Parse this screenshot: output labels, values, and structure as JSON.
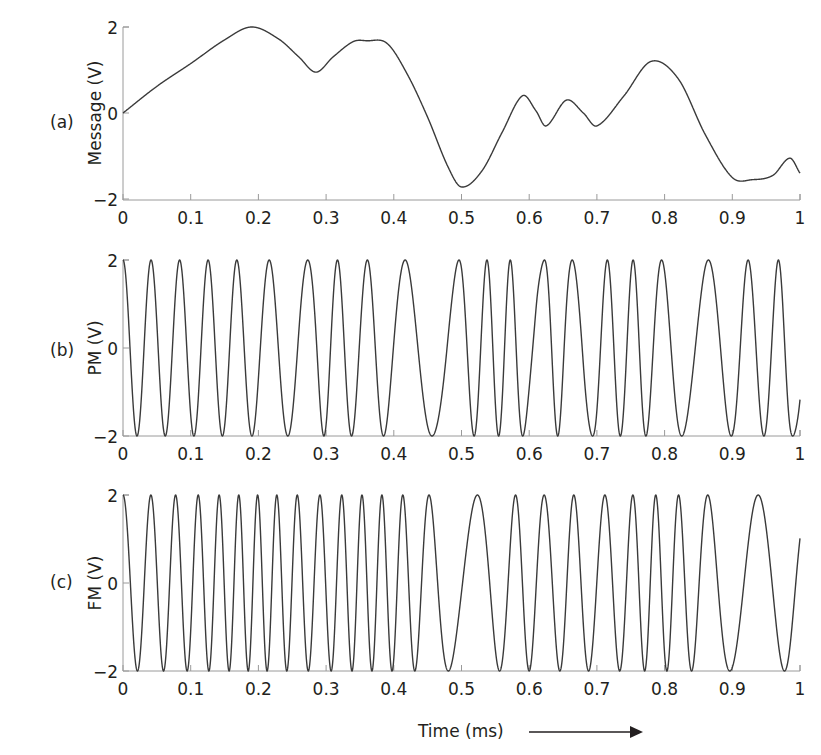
{
  "figure": {
    "xlabel": "Time (ms)",
    "arrow": "right-arrow"
  },
  "panels": [
    {
      "tag": "(a)",
      "ylabel": "Message (V)"
    },
    {
      "tag": "(b)",
      "ylabel": "PM (V)"
    },
    {
      "tag": "(c)",
      "ylabel": "FM (V)"
    }
  ],
  "chart_data": [
    {
      "type": "line",
      "title": "",
      "panel_tag": "(a)",
      "xlabel": "",
      "ylabel": "Message (V)",
      "xlim": [
        0,
        1
      ],
      "ylim": [
        -2,
        2
      ],
      "xticks": [
        "0",
        "0.1",
        "0.2",
        "0.3",
        "0.4",
        "0.5",
        "0.6",
        "0.7",
        "0.8",
        "0.9",
        "1"
      ],
      "yticks": [
        "−2",
        "0",
        "2"
      ],
      "grid": false,
      "x": [
        0,
        0.05,
        0.1,
        0.15,
        0.19,
        0.23,
        0.26,
        0.285,
        0.31,
        0.34,
        0.36,
        0.39,
        0.42,
        0.45,
        0.48,
        0.5,
        0.53,
        0.56,
        0.59,
        0.61,
        0.625,
        0.655,
        0.68,
        0.7,
        0.74,
        0.78,
        0.82,
        0.86,
        0.9,
        0.93,
        0.96,
        0.985,
        1
      ],
      "values": [
        0,
        0.62,
        1.15,
        1.7,
        2.0,
        1.72,
        1.3,
        0.95,
        1.3,
        1.66,
        1.68,
        1.62,
        0.9,
        -0.1,
        -1.25,
        -1.72,
        -1.35,
        -0.45,
        0.4,
        0.05,
        -0.3,
        0.3,
        0.0,
        -0.3,
        0.4,
        1.2,
        0.8,
        -0.5,
        -1.5,
        -1.55,
        -1.45,
        -1.05,
        -1.4
      ]
    },
    {
      "type": "line",
      "title": "",
      "panel_tag": "(b)",
      "xlabel": "",
      "ylabel": "PM (V)",
      "xlim": [
        0,
        1
      ],
      "ylim": [
        -2,
        2
      ],
      "xticks": [
        "0",
        "0.1",
        "0.2",
        "0.3",
        "0.4",
        "0.5",
        "0.6",
        "0.7",
        "0.8",
        "0.9",
        "1"
      ],
      "yticks": [
        "−2",
        "0",
        "2"
      ],
      "grid": false,
      "model": {
        "amplitude": 2,
        "carrier_cycles_per_ms": 21,
        "phase_sensitivity_rad_per_V": 1.57
      },
      "description": "Phase-modulated carrier, amplitude 2 V; cycles widen where message falls steeply (near 0.46 ms)"
    },
    {
      "type": "line",
      "title": "",
      "panel_tag": "(c)",
      "xlabel": "Time (ms)",
      "ylabel": "FM (V)",
      "xlim": [
        0,
        1
      ],
      "ylim": [
        -2,
        2
      ],
      "xticks": [
        "0",
        "0.1",
        "0.2",
        "0.3",
        "0.4",
        "0.5",
        "0.6",
        "0.7",
        "0.8",
        "0.9",
        "1"
      ],
      "yticks": [
        "−2",
        "0",
        "2"
      ],
      "grid": false,
      "model": {
        "amplitude": 2,
        "carrier_cycles_per_ms": 22.5,
        "freq_sensitivity_kHz_per_V": 6.8
      },
      "description": "Frequency-modulated carrier, amplitude 2 V; dense where message is high (0.1-0.4 ms), sparse near 0.5 ms and 0.93 ms"
    }
  ]
}
